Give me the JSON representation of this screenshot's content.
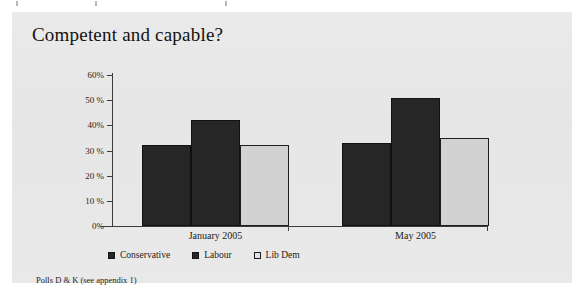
{
  "panel": {
    "background_color": "#e8e8e8"
  },
  "chart_data": {
    "type": "bar",
    "title": "Competent and capable?",
    "xlabel": "",
    "ylabel": "",
    "categories": [
      "January 2005",
      "May 2005"
    ],
    "series": [
      {
        "name": "Conservative",
        "values": [
          32,
          33
        ],
        "color": "#262626",
        "swatch": "dark"
      },
      {
        "name": "Labour",
        "values": [
          42,
          51
        ],
        "color": "#262626",
        "swatch": "dark"
      },
      {
        "name": "Lib Dem",
        "values": [
          32,
          35
        ],
        "color": "#d2d2d2",
        "swatch": "light"
      }
    ],
    "ylim": [
      0,
      60
    ],
    "yticks": [
      0,
      10,
      20,
      30,
      40,
      50,
      60
    ],
    "ytick_labels": [
      "0%",
      "10 %",
      "20 %",
      "30 %",
      "40%",
      "50 %",
      "60%"
    ],
    "grid": false,
    "legend_position": "bottom"
  },
  "footnote": {
    "text": "Polls D & K (see appendix 1)"
  }
}
